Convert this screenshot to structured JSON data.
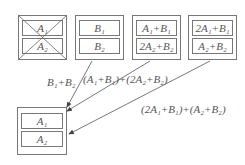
{
  "diagram": {
    "top_boxes": [
      {
        "id": "box-a",
        "crossed": true,
        "slots": [
          "A₁",
          "A₂"
        ]
      },
      {
        "id": "box-b",
        "crossed": false,
        "slots": [
          "B₁",
          "B₂"
        ]
      },
      {
        "id": "box-c",
        "crossed": false,
        "slots": [
          "A₁+B₁",
          "2A₂+B₂"
        ]
      },
      {
        "id": "box-d",
        "crossed": false,
        "slots": [
          "2A₁+B₁",
          "A₂+B₂"
        ]
      }
    ],
    "result_box": {
      "slots": [
        "A₁",
        "A₂"
      ]
    },
    "arrow_labels": [
      "B₁+B₂",
      "(A₁+B₁)+(2A₂+B₂)",
      "(2A₁+B₁)+(A₂+B₂)"
    ],
    "colors": {
      "line": "#666666",
      "text": "#555555"
    }
  }
}
